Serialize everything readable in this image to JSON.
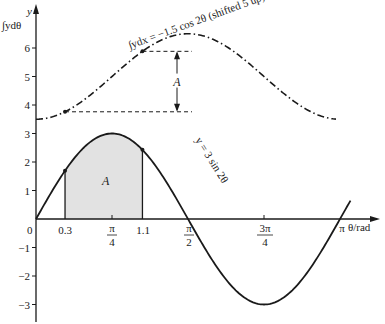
{
  "chart_data": {
    "type": "line",
    "title": "",
    "xlabel": "θ/rad",
    "ylabel": "y",
    "ylabel2": "∫ydθ",
    "xlim": [
      0,
      3.1416
    ],
    "ylim": [
      -3,
      6.5
    ],
    "grid": false,
    "x_ticks": [
      {
        "value": 0.3,
        "label": "0.3"
      },
      {
        "value": 0.7854,
        "label_num": "π",
        "label_den": "4"
      },
      {
        "value": 1.1,
        "label": "1.1"
      },
      {
        "value": 1.5708,
        "label_num": "π",
        "label_den": "2"
      },
      {
        "value": 2.3562,
        "label_num": "3π",
        "label_den": "4"
      },
      {
        "value": 3.1416,
        "label": "π"
      }
    ],
    "origin_label": "0",
    "y_ticks": [
      -3,
      -2,
      -1,
      1,
      2,
      3,
      4,
      5,
      6
    ],
    "series": [
      {
        "name": "y = 3 sin 2θ",
        "style": "solid",
        "x": [
          0,
          0.3,
          0.5236,
          0.7854,
          1.0472,
          1.1,
          1.5708,
          2.0944,
          2.3562,
          2.618,
          3.1416
        ],
        "values": [
          0,
          1.69,
          2.6,
          3.0,
          2.6,
          2.43,
          0,
          -2.6,
          -3.0,
          -2.6,
          0
        ]
      },
      {
        "name": "∫ydx = −1.5 cos 2θ (shifted 5 up)",
        "style": "dash-dot",
        "x": [
          0,
          0.3,
          0.7854,
          1.1,
          1.5708,
          2.3562,
          3.1416
        ],
        "values": [
          3.5,
          3.76,
          5.0,
          5.89,
          6.5,
          5.0,
          3.5
        ]
      }
    ],
    "annotations": [
      {
        "text": "A",
        "note": "shaded area under y = 3 sin 2θ between θ = 0.3 and θ = 1.1"
      },
      {
        "text": "A",
        "note": "vertical double arrow showing difference of integral values between θ = 0.3 and θ = 1.1"
      }
    ],
    "shaded_region": {
      "from": 0.3,
      "to": 1.1,
      "color": "#e2e2e2"
    }
  },
  "labels": {
    "y_axis": "y",
    "integral_axis": "∫ydθ",
    "x_axis": "θ/rad",
    "origin": "0",
    "sine_curve": "y = 3 sin 2θ",
    "integral_curve": "∫ydx = −1.5 cos 2θ (shifted 5 up)",
    "area": "A",
    "difference": "A",
    "tick_03": "0.3",
    "tick_11": "1.1",
    "tick_pi": "π",
    "pi": "π",
    "three_pi": "3π",
    "den_4": "4",
    "den_2": "2",
    "y_m3": "−3",
    "y_m2": "−2",
    "y_m1": "−1",
    "y_1": "1",
    "y_2": "2",
    "y_3": "3",
    "y_4": "4",
    "y_5": "5",
    "y_6": "6"
  },
  "colors": {
    "line": "#1a1a1a",
    "shade": "#e2e2e2",
    "background": "#ffffff"
  }
}
